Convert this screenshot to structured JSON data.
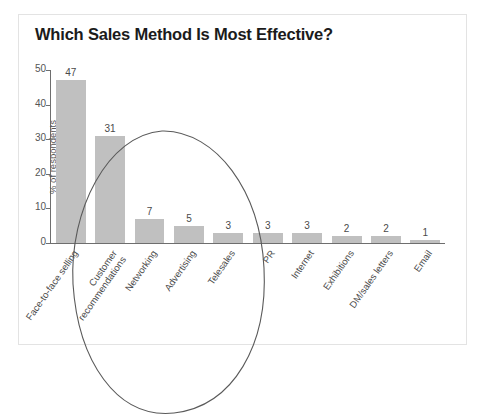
{
  "card": {
    "title": "Which Sales Method Is Most Effective?"
  },
  "chart_data": {
    "type": "bar",
    "title": "Which Sales Method Is Most Effective?",
    "xlabel": "",
    "ylabel": "% of respondents",
    "ylim": [
      0,
      50
    ],
    "yticks": [
      0,
      10,
      20,
      30,
      40,
      50
    ],
    "grid": false,
    "legend": false,
    "categories": [
      "Face-to-face selling",
      "Customer recommendations",
      "Networking",
      "Advertising",
      "Telesales",
      "PR",
      "Internet",
      "Exhibitions",
      "DM/sales letters",
      "Email"
    ],
    "values": [
      47,
      31,
      7,
      5,
      3,
      3,
      3,
      2,
      2,
      1
    ],
    "bar_color": "#c0c0c0",
    "annotations": [
      {
        "name": "highlight-ellipse",
        "shape": "ellipse",
        "note": "hand-drawn oval circling the top three methods",
        "encircles": [
          "Face-to-face selling",
          "Customer recommendations",
          "Networking"
        ]
      }
    ]
  }
}
